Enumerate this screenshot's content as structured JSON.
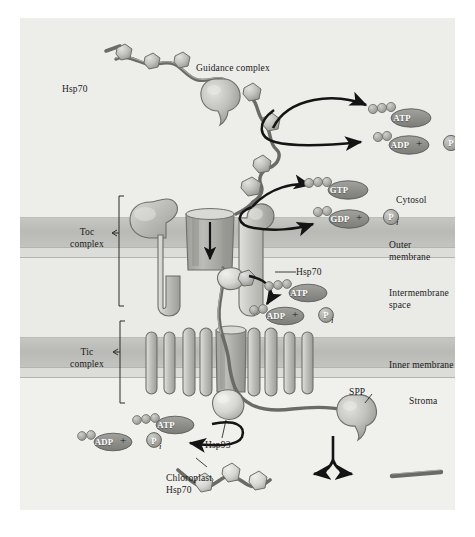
{
  "figure": {
    "background": "#ffffff",
    "panel_background": "#f2f2f0"
  },
  "colors": {
    "membrane_band": "#c0c0bd",
    "membrane_line": "#8d8d8a",
    "compartment_light": "#eaeae7",
    "protein_fill": "#b8b8b4",
    "protein_fill_light": "#d2d2ce",
    "protein_stroke": "#6d6d69",
    "nucleotide_fill": "#8e8e8a",
    "phosphate_fill": "#a8a8a4",
    "chain_stroke": "#5f5f5b",
    "arrow": "#141414",
    "text": "#1a1a1a"
  },
  "compartments": [
    {
      "name": "cytosol",
      "label": "Cytosol",
      "x": 396,
      "y": 183
    },
    {
      "name": "outer-membrane",
      "label": "Outer membrane",
      "x": 389,
      "y": 228
    },
    {
      "name": "intermembrane-space",
      "label": "Intermembrane\nspace",
      "x": 389,
      "y": 282
    },
    {
      "name": "inner-membrane",
      "label": "Inner membrane",
      "x": 389,
      "y": 350
    },
    {
      "name": "stroma",
      "label": "Stroma",
      "x": 409,
      "y": 385
    }
  ],
  "complexes": [
    {
      "name": "toc-complex",
      "label": "Toc\ncomplex",
      "x": 57,
      "y": 227
    },
    {
      "name": "tic-complex",
      "label": "Tic\ncomplex",
      "x": 57,
      "y": 347
    }
  ],
  "molecule_labels": [
    {
      "name": "hsp70-cytosolic",
      "label": "Hsp70",
      "x": 62,
      "y": 72,
      "align": "left"
    },
    {
      "name": "guidance-complex",
      "label": "Guidance complex",
      "x": 196,
      "y": 51,
      "align": "left"
    },
    {
      "name": "hsp70-intermembrane",
      "label": "Hsp70",
      "x": 288,
      "y": 256,
      "align": "left"
    },
    {
      "name": "hsp93",
      "label": "Hsp93",
      "x": 205,
      "y": 428,
      "align": "left"
    },
    {
      "name": "spp",
      "label": "SPP",
      "x": 349,
      "y": 409,
      "align": "left"
    },
    {
      "name": "chloroplast-hsp70",
      "label": "Chloroplast\nHsp70",
      "x": 166,
      "y": 464,
      "align": "left"
    }
  ],
  "reactions": [
    {
      "name": "cytosolic-atp-hydrolysis",
      "substrate": "ATP",
      "product": "ADP",
      "phosphate": "P",
      "phosphate_subscript": "i",
      "substrate_pos": {
        "x": 392,
        "y": 101
      },
      "product_pos": {
        "x": 396,
        "y": 127
      },
      "plus_pos": {
        "x": 422,
        "y": 122
      },
      "pi_pos": {
        "x": 436,
        "y": 124
      }
    },
    {
      "name": "toc-gtp-hydrolysis",
      "substrate": "GTP",
      "product": "GDP",
      "phosphate": "P",
      "phosphate_subscript": "i",
      "substrate_pos": {
        "x": 329,
        "y": 167
      },
      "product_pos": {
        "x": 336,
        "y": 197
      },
      "plus_pos": {
        "x": 362,
        "y": 192
      },
      "pi_pos": {
        "x": 376,
        "y": 194
      }
    },
    {
      "name": "intermembrane-atp-hydrolysis",
      "substrate": "ATP",
      "product": "ADP",
      "phosphate": "P",
      "phosphate_subscript": "i",
      "substrate_pos": {
        "x": 289,
        "y": 276
      },
      "product_pos": {
        "x": 272,
        "y": 299
      },
      "plus_pos": {
        "x": 298,
        "y": 294
      },
      "pi_pos": {
        "x": 312,
        "y": 296
      }
    },
    {
      "name": "stromal-atp-hydrolysis",
      "substrate": "ATP",
      "product": "ADP",
      "phosphate": "P",
      "phosphate_subscript": "i",
      "substrate_pos": {
        "x": 156,
        "y": 408
      },
      "product_pos": {
        "x": 100,
        "y": 424
      },
      "plus_pos": {
        "x": 126,
        "y": 419
      },
      "pi_pos": {
        "x": 140,
        "y": 421
      }
    }
  ],
  "nucleotide_caps": {
    "triphosphate_circles": 3,
    "diphosphate_circles": 2
  }
}
